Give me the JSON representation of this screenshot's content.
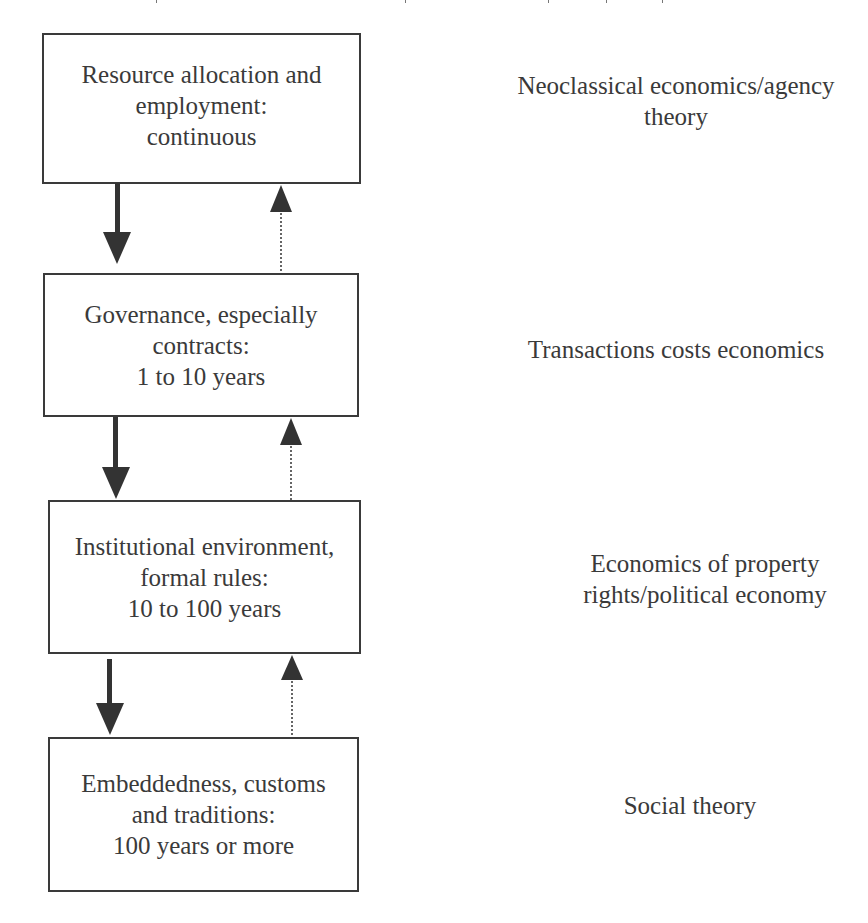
{
  "diagram": {
    "type": "four-level layered framework",
    "colors": {
      "box_border": "#3a3a3a",
      "text": "#3a3a3a",
      "arrow_solid": "#333333",
      "arrow_dotted": "#333333",
      "background": "#ffffff"
    },
    "levels": [
      {
        "id": "level-1",
        "lines": [
          "Resource allocation and",
          "employment:",
          "continuous"
        ],
        "theory_lines": [
          "Neoclassical economics/agency",
          "theory"
        ]
      },
      {
        "id": "level-2",
        "lines": [
          "Governance, especially",
          "contracts:",
          "1 to 10 years"
        ],
        "theory_lines": [
          "Transactions costs economics"
        ]
      },
      {
        "id": "level-3",
        "lines": [
          "Institutional environment,",
          "formal rules:",
          "10 to 100 years"
        ],
        "theory_lines": [
          "Economics of property",
          "rights/political economy"
        ]
      },
      {
        "id": "level-4",
        "lines": [
          "Embeddedness, customs",
          "and traditions:",
          "100 years or more"
        ],
        "theory_lines": [
          "Social theory"
        ]
      }
    ],
    "connectors": [
      {
        "from": "level-1",
        "to": "level-2",
        "style": "solid",
        "direction": "down"
      },
      {
        "from": "level-2",
        "to": "level-1",
        "style": "dotted",
        "direction": "up"
      },
      {
        "from": "level-2",
        "to": "level-3",
        "style": "solid",
        "direction": "down"
      },
      {
        "from": "level-3",
        "to": "level-2",
        "style": "dotted",
        "direction": "up"
      },
      {
        "from": "level-3",
        "to": "level-4",
        "style": "solid",
        "direction": "down"
      },
      {
        "from": "level-4",
        "to": "level-3",
        "style": "dotted",
        "direction": "up"
      }
    ]
  }
}
